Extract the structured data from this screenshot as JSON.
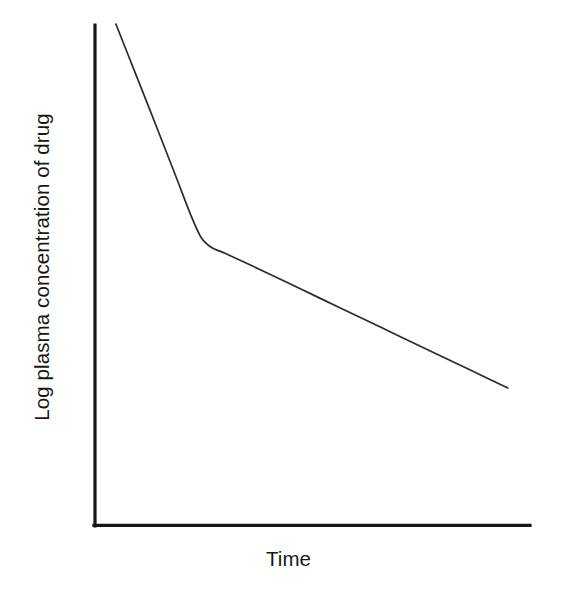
{
  "chart_data": {
    "type": "line",
    "title": "",
    "subtitle": "",
    "xlabel": "Time",
    "ylabel": "Log plasma concentration of drug",
    "grid": false,
    "legend": false,
    "legend_position": "none",
    "axis_ticks": [],
    "xticklabels": [],
    "yticklabels": [],
    "xlim": [
      0,
      1
    ],
    "ylim": [
      0,
      1
    ],
    "annotations": [],
    "series": [
      {
        "name": "Log plasma concentration of drug",
        "color": "#2b2b2b",
        "x": [
          0.048,
          0.092,
          0.14,
          0.186,
          0.22,
          0.244,
          0.268,
          0.3,
          0.38,
          0.472,
          0.564,
          0.656,
          0.748,
          0.84,
          0.92,
          0.949
        ],
        "y": [
          0.996,
          0.9,
          0.795,
          0.693,
          0.617,
          0.572,
          0.552,
          0.54,
          0.508,
          0.47,
          0.432,
          0.394,
          0.356,
          0.318,
          0.285,
          0.273
        ],
        "phases": [
          {
            "name": "distribution-phase",
            "slope": "steep",
            "x_range": [
              0.048,
              0.22
            ]
          },
          {
            "name": "transition-knee",
            "slope": "curving",
            "x_range": [
              0.22,
              0.3
            ]
          },
          {
            "name": "elimination-phase",
            "slope": "shallow",
            "x_range": [
              0.3,
              0.949
            ]
          }
        ]
      }
    ]
  },
  "axes": {
    "y_axis_name": "y-axis",
    "x_axis_name": "x-axis",
    "color": "#171717"
  },
  "labels": {
    "y": "Log plasma concentration of drug",
    "x": "Time"
  },
  "colors": {
    "background": "#ffffff",
    "axis": "#171717",
    "curve": "#2b2b2b"
  }
}
